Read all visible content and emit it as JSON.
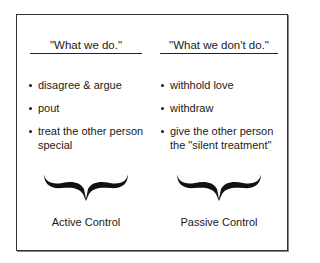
{
  "diagram": {
    "columns": [
      {
        "id": "active",
        "header": "\"What we do.\"",
        "items": [
          "disagree & argue",
          "pout",
          "treat the other person special"
        ],
        "caption": "Active Control",
        "brace_icon": "curly-brace-under"
      },
      {
        "id": "passive",
        "header": "\"What we don't do.\"",
        "items": [
          "withhold love",
          "withdraw",
          "give the other person the \"silent treatment\""
        ],
        "caption": "Passive Control",
        "brace_icon": "curly-brace-under"
      }
    ],
    "colors": {
      "text": "#1a1a1a",
      "border": "#333333",
      "background": "#ffffff"
    }
  }
}
